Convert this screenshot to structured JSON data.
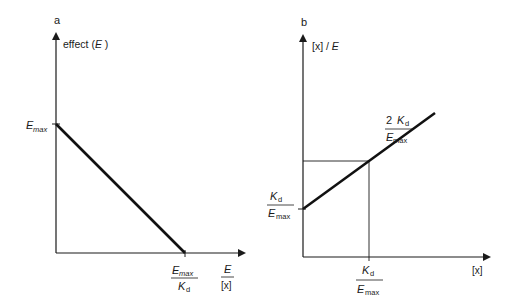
{
  "panels": {
    "a": {
      "label": "a",
      "y_axis_label_prefix": "effect (",
      "y_axis_label_var": "E",
      "y_axis_label_suffix": " )",
      "y_intercept": {
        "main": "E",
        "sub": "max"
      },
      "x_intercept": {
        "num_main": "E",
        "num_sub": "max",
        "den_main": "K",
        "den_sub": "d"
      },
      "x_axis_label": {
        "num": "E",
        "den": "[x]"
      }
    },
    "b": {
      "label": "b",
      "y_axis_label_prefix": "[x] / ",
      "y_axis_label_var": "E",
      "y_intercept": {
        "num_main": "K",
        "num_sub": "d",
        "den_main": "E",
        "den_sub": "max"
      },
      "guide_y": {
        "num_coef": "2 ",
        "num_main": "K",
        "num_sub": "d",
        "den_main": "E",
        "den_sub": "max"
      },
      "guide_x": {
        "num_main": "K",
        "num_sub": "d",
        "den_main": "E",
        "den_sub": "max"
      },
      "x_axis_label": "[x]"
    }
  },
  "chart_data": [
    {
      "type": "line",
      "title": "a",
      "xlabel": "E / [x]",
      "ylabel": "effect (E)",
      "description": "Scatchard-type plot: effect decreases linearly from Emax (y-intercept) to Emax/Kd (x-intercept)",
      "series": [
        {
          "name": "effect",
          "x": [
            0,
            1
          ],
          "y": [
            1,
            0
          ]
        }
      ],
      "x_ticks": [
        {
          "value": 1,
          "label": "Emax/Kd"
        }
      ],
      "y_ticks": [
        {
          "value": 1,
          "label": "Emax"
        }
      ],
      "xlim": [
        0,
        1.47
      ],
      "ylim": [
        0,
        1.71
      ]
    },
    {
      "type": "line",
      "title": "b",
      "xlabel": "[x]",
      "ylabel": "[x] / E",
      "description": "Linear plot of [x]/E vs [x]; y-intercept Kd/Emax; at [x]=Kd the value is 2Kd/Emax",
      "series": [
        {
          "name": "[x]/E",
          "x": [
            0,
            1,
            2
          ],
          "y": [
            1,
            2,
            3
          ]
        }
      ],
      "x_ticks": [
        {
          "value": 1,
          "label": "Kd/Emax"
        }
      ],
      "y_ticks": [
        {
          "value": 1,
          "label": "Kd/Emax"
        },
        {
          "value": 2,
          "label": "2 Kd/Emax"
        }
      ],
      "guides": [
        {
          "x": 1,
          "y": 2
        }
      ],
      "xlim": [
        0,
        2.82
      ],
      "ylim": [
        0,
        2.66
      ]
    }
  ]
}
